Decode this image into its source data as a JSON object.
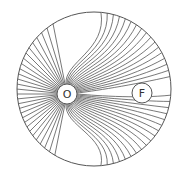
{
  "diagram": {
    "type": "field-lines",
    "colors": {
      "background": "#ffffff",
      "stroke": "#555555",
      "node_fill": "#ffffff",
      "label": "#333333"
    },
    "boundary": {
      "cx": 94,
      "cy": 89,
      "r": 77
    },
    "nodes": [
      {
        "id": "O",
        "label": "O",
        "cx": 67,
        "cy": 94,
        "r": 10
      },
      {
        "id": "F",
        "label": "F",
        "cx": 142,
        "cy": 93,
        "r": 10
      }
    ],
    "line_count": 64
  }
}
